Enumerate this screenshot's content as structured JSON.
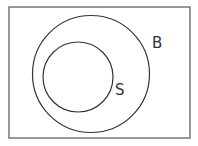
{
  "diagram": {
    "type": "venn",
    "universe": {
      "label": ""
    },
    "sets": [
      {
        "label": "B",
        "contains": [
          "S"
        ]
      },
      {
        "label": "S",
        "subset_of": "B"
      }
    ],
    "colors": {
      "stroke": "#333333",
      "background": "#ffffff",
      "frame": "#555555"
    }
  }
}
